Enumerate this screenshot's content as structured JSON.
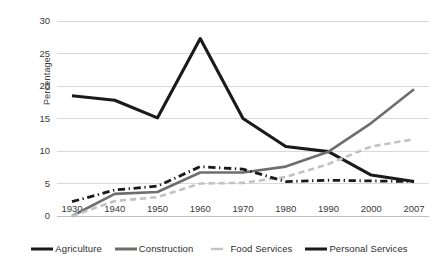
{
  "chart_data": {
    "type": "line",
    "title": "",
    "xlabel": "",
    "ylabel": "Percentage",
    "categories": [
      "1930",
      "1940",
      "1950",
      "1960",
      "1970",
      "1980",
      "1990",
      "2000",
      "2007"
    ],
    "x": [
      1930,
      1940,
      1950,
      1960,
      1970,
      1980,
      1990,
      2000,
      2007
    ],
    "ylim": [
      0,
      30
    ],
    "yticks": [
      0,
      5,
      10,
      15,
      20,
      25,
      30
    ],
    "grid": true,
    "legend_position": "bottom",
    "series": [
      {
        "name": "Agriculture",
        "color": "#1a1a1a",
        "style": "solid",
        "width": 3.1,
        "values": [
          18.5,
          17.8,
          15.1,
          27.3,
          15.0,
          10.7,
          9.9,
          6.3,
          5.3
        ]
      },
      {
        "name": "Construction",
        "color": "#6e6e6e",
        "style": "solid",
        "width": 2.6,
        "values": [
          0.0,
          3.4,
          3.7,
          6.7,
          6.7,
          7.6,
          9.9,
          14.3,
          19.5
        ]
      },
      {
        "name": "Food Services",
        "color": "#c2c2c2",
        "style": "dashed",
        "width": 2.6,
        "values": [
          0.0,
          2.3,
          2.9,
          5.0,
          5.1,
          6.0,
          8.0,
          10.7,
          11.8
        ]
      },
      {
        "name": "Personal Services",
        "color": "#1a1a1a",
        "style": "dashdot",
        "width": 2.8,
        "values": [
          2.2,
          4.0,
          4.6,
          7.6,
          7.2,
          5.3,
          5.5,
          5.4,
          5.3
        ]
      }
    ]
  },
  "axes": {
    "y_title": "Percentage",
    "y_tick_labels": [
      "30",
      "25",
      "20",
      "15",
      "10",
      "5",
      "0"
    ],
    "x_tick_labels": [
      "1930",
      "1940",
      "1950",
      "1960",
      "1970",
      "1980",
      "1990",
      "2000",
      "2007"
    ]
  },
  "legend": {
    "items": [
      {
        "label": "Agriculture",
        "color": "#1a1a1a",
        "style": "solid"
      },
      {
        "label": "Construction",
        "color": "#6e6e6e",
        "style": "solid"
      },
      {
        "label": "Food Services",
        "color": "#c2c2c2",
        "style": "dashed"
      },
      {
        "label": "Personal Services",
        "color": "#1a1a1a",
        "style": "solid"
      }
    ]
  },
  "colors": {
    "gridline": "#d9d9d9",
    "axis_line": "#bfbfbf",
    "tick_text": "#3a3a3a",
    "background": "#ffffff"
  }
}
